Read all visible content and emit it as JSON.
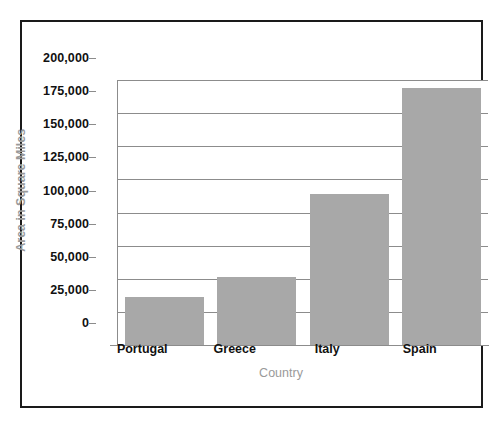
{
  "chart_data": {
    "type": "bar",
    "title": "",
    "subtitle": "",
    "xlabel": "Country",
    "ylabel": "Area in Square Miles",
    "categories": [
      "Portugal",
      "Greece",
      "Italy",
      "Spain"
    ],
    "values": [
      36000,
      51000,
      114000,
      194000
    ],
    "series": [
      {
        "name": "Area in Square Miles",
        "values": [
          36000,
          51000,
          114000,
          194000
        ]
      }
    ],
    "ylim": [
      0,
      200000
    ],
    "xlim": [
      0,
      4
    ],
    "y_tick_values": [
      0,
      25000,
      50000,
      75000,
      100000,
      125000,
      150000,
      175000,
      200000
    ],
    "y_tick_labels": [
      "0",
      "25,000",
      "50,000",
      "75,000",
      "100,000",
      "125,000",
      "150,000",
      "175,000",
      "200,000"
    ],
    "grid": true,
    "grid_axis": "y",
    "legend": false,
    "legend_position": "none",
    "bar_color": "#a8a8a8",
    "grid_color": "#8c8c8c",
    "axis_color": "#8c8c8c",
    "tick_label_color": "#111111",
    "axis_title_color": "#9a9a9a",
    "background_color": "#ffffff",
    "frame_color": "#1a1a1a",
    "annotations": []
  }
}
